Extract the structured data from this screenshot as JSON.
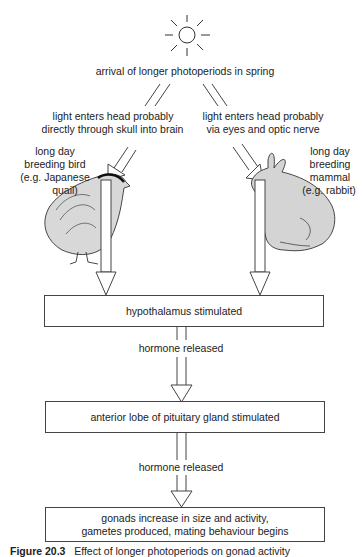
{
  "top": {
    "icon": "sun-icon",
    "trigger": "arrival of longer photoperiods in spring"
  },
  "left_branch": {
    "path_text_line1": "light enters head probably",
    "path_text_line2": "directly through skull into brain",
    "animal_label_line1": "long day",
    "animal_label_line2": "breeding bird",
    "animal_label_line3": "(e.g. Japanese",
    "animal_label_line4": "quail)",
    "animal_icon": "quail-icon"
  },
  "right_branch": {
    "path_text_line1": "light enters head probably",
    "path_text_line2": "via eyes and optic nerve",
    "animal_label_line1": "long day",
    "animal_label_line2": "breeding",
    "animal_label_line3": "mammal",
    "animal_label_line4": "(e.g. rabbit)",
    "animal_icon": "rabbit-icon"
  },
  "steps": [
    {
      "label": "hypothalamus stimulated"
    },
    {
      "connector": "hormone released"
    },
    {
      "label": "anterior lobe of pituitary gland stimulated"
    },
    {
      "connector": "hormone released"
    },
    {
      "label_line1": "gonads increase in size and activity,",
      "label_line2": "gametes produced, mating behaviour begins"
    }
  ],
  "caption": {
    "number": "Figure 20.3",
    "text": "Effect of longer photoperiods on gonad activity"
  }
}
